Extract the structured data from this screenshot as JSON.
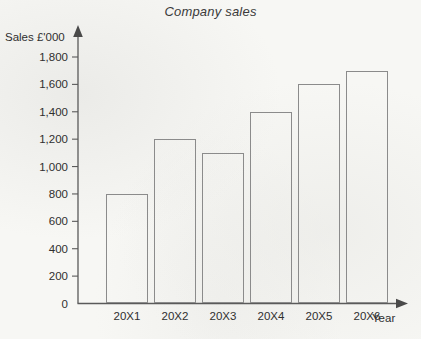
{
  "chart_data": {
    "type": "bar",
    "title": "Company sales",
    "xlabel": "Year",
    "ylabel": "Sales £'000",
    "categories": [
      "20X1",
      "20X2",
      "20X3",
      "20X4",
      "20X5",
      "20X6"
    ],
    "values": [
      800,
      1200,
      1100,
      1400,
      1600,
      1700
    ],
    "ylim": [
      0,
      1800
    ],
    "ytick_labels": [
      "0",
      "200",
      "400",
      "600",
      "800",
      "1,000",
      "1,200",
      "1,400",
      "1,600",
      "1,800"
    ],
    "ytick_values": [
      0,
      200,
      400,
      600,
      800,
      1000,
      1200,
      1400,
      1600,
      1800
    ],
    "grid": false,
    "legend": false,
    "bar_fill": "none",
    "bar_edge_color": "#8b8b8b",
    "axis_color": "#5a5a5a",
    "background_color": "#f7f7f4",
    "text_color": "#2f2f2f"
  }
}
